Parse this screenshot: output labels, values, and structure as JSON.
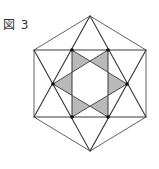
{
  "figure": {
    "label": "図 3"
  },
  "colors": {
    "line": "#3a3a3a",
    "shade": "#b9b9b9",
    "background": "#ffffff"
  },
  "geometry": {
    "outer_hexagon": [
      [
        90,
        16
      ],
      [
        146,
        50
      ],
      [
        146,
        117
      ],
      [
        90,
        151
      ],
      [
        34,
        117
      ],
      [
        34,
        50
      ]
    ],
    "big_triangle_up": [
      [
        90,
        16
      ],
      [
        146,
        117
      ],
      [
        34,
        117
      ]
    ],
    "big_triangle_down": [
      [
        90,
        151
      ],
      [
        34,
        50
      ],
      [
        146,
        50
      ]
    ],
    "vertical_lines": [
      [
        [
          72,
          50
        ],
        [
          72,
          117
        ]
      ],
      [
        [
          108,
          50
        ],
        [
          108,
          117
        ]
      ]
    ],
    "inner_star_lines": [
      [
        [
          53,
          84
        ],
        [
          108,
          50
        ]
      ],
      [
        [
          53,
          84
        ],
        [
          108,
          117
        ]
      ],
      [
        [
          127,
          84
        ],
        [
          72,
          50
        ]
      ],
      [
        [
          127,
          84
        ],
        [
          72,
          117
        ]
      ]
    ],
    "dots": [
      [
        72,
        50
      ],
      [
        108,
        50
      ],
      [
        53,
        84
      ],
      [
        127,
        84
      ],
      [
        72,
        117
      ],
      [
        108,
        117
      ]
    ],
    "shaded_triangles": [
      [
        [
          53,
          84
        ],
        [
          72,
          72.3
        ],
        [
          72,
          95.7
        ]
      ],
      [
        [
          127,
          84
        ],
        [
          108,
          72.3
        ],
        [
          108,
          95.7
        ]
      ],
      [
        [
          72,
          50
        ],
        [
          90,
          61.1
        ],
        [
          72,
          72.3
        ]
      ],
      [
        [
          108,
          50
        ],
        [
          90,
          61.1
        ],
        [
          108,
          72.3
        ]
      ],
      [
        [
          72,
          117
        ],
        [
          90,
          105.9
        ],
        [
          72,
          95.7
        ]
      ],
      [
        [
          108,
          117
        ],
        [
          90,
          105.9
        ],
        [
          108,
          95.7
        ]
      ]
    ]
  }
}
